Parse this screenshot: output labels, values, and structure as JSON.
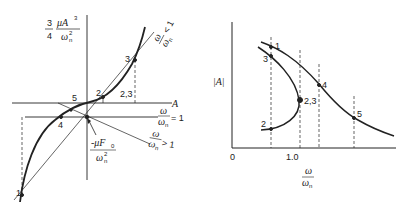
{
  "left_diagram": {
    "y_label": {
      "coef_num": "3",
      "coef_den": "4",
      "num": "μA",
      "num_exp": "3",
      "den": "ω",
      "den_exp": "2",
      "den_sub": "n"
    },
    "x_label": "A",
    "forcing_label": {
      "num": "-μF",
      "num_sub": "0",
      "den": "ω",
      "den_exp": "2",
      "den_sub": "n"
    },
    "lines": [
      {
        "num": "ω",
        "den": "ω",
        "den_sub": "n",
        "relation": "< 1"
      },
      {
        "num": "ω",
        "den": "ω",
        "den_sub": "n",
        "relation": "= 1"
      },
      {
        "num": "ω",
        "den": "ω",
        "den_sub": "n",
        "relation": "> 1"
      }
    ],
    "points": [
      "1",
      "2",
      "3",
      "4",
      "5",
      "2,3"
    ]
  },
  "right_diagram": {
    "y_label": "|A|",
    "x_label": {
      "num": "ω",
      "den": "ω",
      "den_sub": "n"
    },
    "x_ticks": [
      "0",
      "1.0"
    ],
    "points": [
      "1",
      "3",
      "4",
      "2,3",
      "2",
      "5"
    ]
  }
}
